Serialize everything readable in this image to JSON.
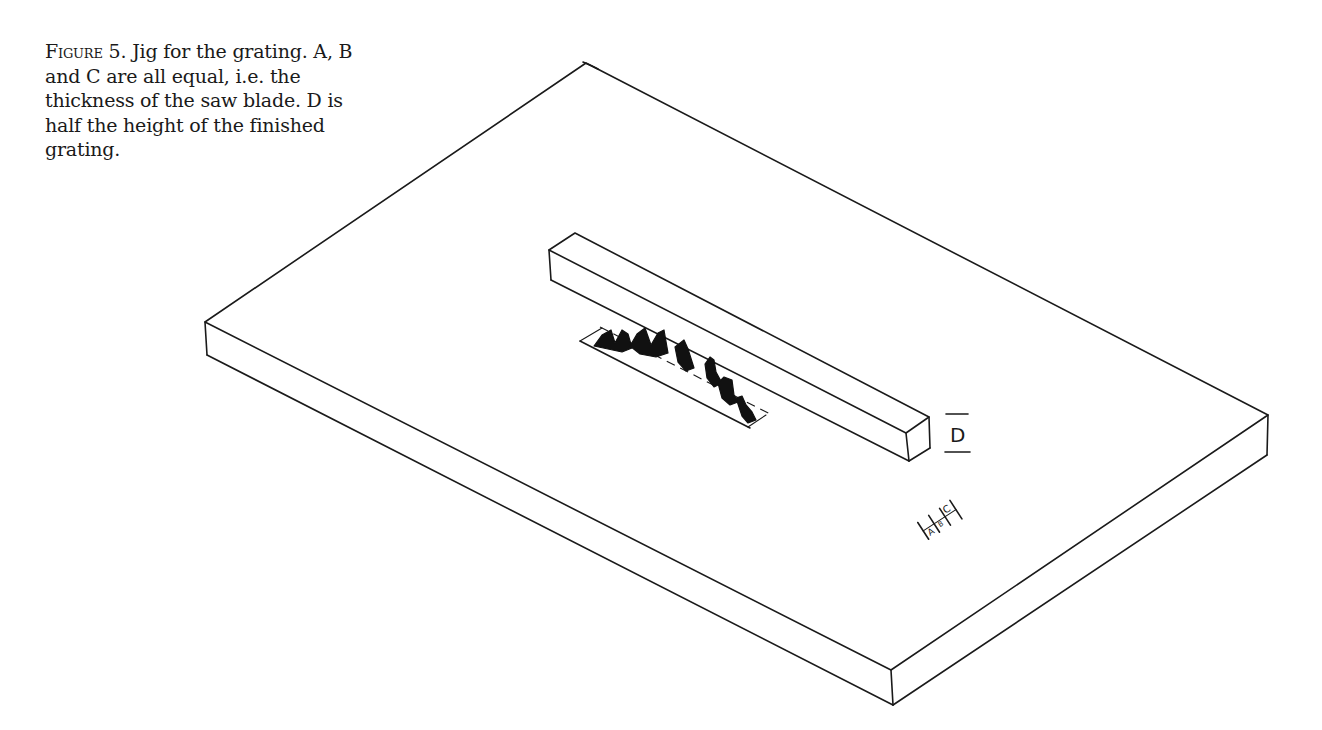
{
  "figure": {
    "label": "Figure 5.",
    "caption": "Jig for the grating. A, B and C are all equal, i.e. the thickness of the saw blade. D is half the height of the finished grating."
  },
  "diagram": {
    "title": "Jig for the grating",
    "parts": [
      {
        "id": "base-board",
        "description": "Flat rectangular base board shown in isometric view"
      },
      {
        "id": "fence-bar",
        "description": "Long square-section guide bar fixed on the board"
      },
      {
        "id": "saw-slot",
        "description": "Slot with saw blade teeth protruding through the board"
      }
    ],
    "labels": {
      "d": "D",
      "a": "A",
      "b": "B",
      "c": "C"
    },
    "dimension_notes": {
      "abc": "A, B and C are all equal (thickness of saw blade)",
      "d": "D is half the height of the finished grating"
    }
  }
}
